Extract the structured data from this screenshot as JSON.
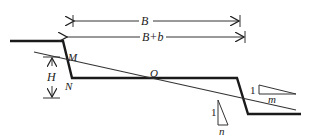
{
  "diagram": {
    "type": "cross-section",
    "labels": {
      "B": "B",
      "B_plus_b": "B+b",
      "M": "M",
      "N": "N",
      "O": "O",
      "H": "H"
    },
    "slope_m": {
      "rise": "1",
      "run": "m"
    },
    "slope_n": {
      "rise": "1",
      "run": "n"
    },
    "colors": {
      "stroke": "#1a1a1a",
      "thin": "#333333"
    }
  }
}
